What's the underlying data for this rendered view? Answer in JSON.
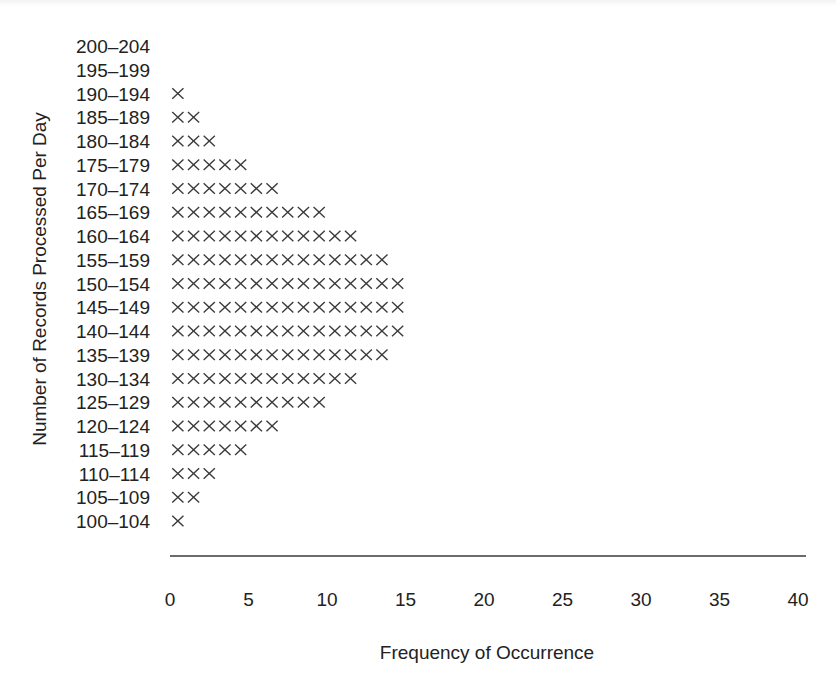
{
  "chart_data": {
    "type": "bar",
    "style": "dot-plot (tally of X marks)",
    "title": "",
    "xlabel": "Frequency of Occurrence",
    "ylabel": "Number of Records Processed Per Day",
    "xlim": [
      0,
      40
    ],
    "x_ticks": [
      "0",
      "5",
      "10",
      "15",
      "20",
      "25",
      "30",
      "35",
      "40"
    ],
    "x_tick_values": [
      0,
      5,
      10,
      15,
      20,
      25,
      30,
      35,
      40
    ],
    "grid": false,
    "legend": "none",
    "mark_symbol": "X",
    "categories": [
      "200–204",
      "195–199",
      "190–194",
      "185–189",
      "180–184",
      "175–179",
      "170–174",
      "165–169",
      "160–164",
      "155–159",
      "150–154",
      "145–149",
      "140–144",
      "135–139",
      "130–134",
      "125–129",
      "120–124",
      "115–119",
      "110–114",
      "105–109",
      "100–104"
    ],
    "values": [
      0,
      0,
      1,
      2,
      3,
      5,
      7,
      10,
      12,
      14,
      15,
      15,
      15,
      14,
      12,
      10,
      7,
      5,
      3,
      2,
      1
    ]
  }
}
